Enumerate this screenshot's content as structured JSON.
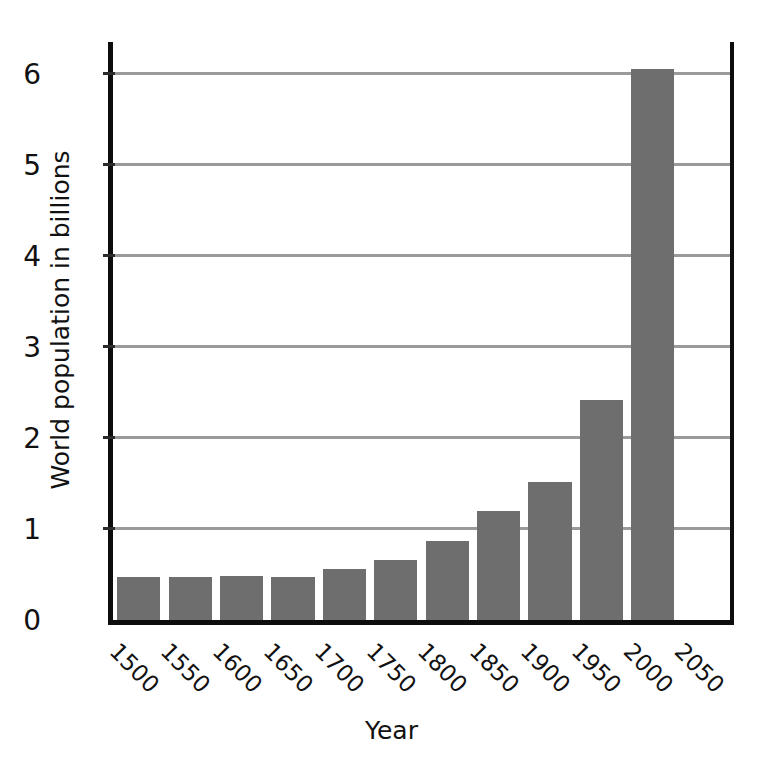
{
  "chart_data": {
    "type": "bar",
    "title": "",
    "xlabel": "Year",
    "ylabel": "World population in billions",
    "categories": [
      "1500",
      "1550",
      "1600",
      "1650",
      "1700",
      "1750",
      "1800",
      "1850",
      "1900",
      "1950",
      "2000",
      "2050"
    ],
    "values": [
      0.47,
      0.47,
      0.48,
      0.47,
      0.56,
      0.66,
      0.87,
      1.2,
      1.52,
      2.42,
      6.05,
      null
    ],
    "ylim": [
      0,
      6.35
    ],
    "y_ticks": [
      0,
      1,
      2,
      3,
      4,
      5,
      6
    ],
    "y_tick_labels": [
      "0",
      "1",
      "2",
      "3",
      "4",
      "5",
      "6"
    ],
    "grid": "horizontal",
    "legend": "none",
    "bar_color": "#6e6e6e",
    "axis_color": "#0d0d0d",
    "gridline_color": "#9a9a9a"
  }
}
